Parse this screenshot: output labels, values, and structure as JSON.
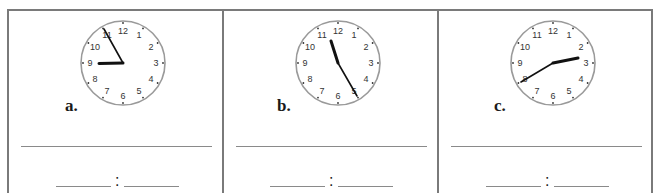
{
  "worksheet": {
    "frame_color": "#7a7a7a",
    "line_color": "#8a8a8a",
    "clocks": [
      {
        "label": "a.",
        "numbers": [
          "12",
          "1",
          "2",
          "3",
          "4",
          "5",
          "6",
          "7",
          "8",
          "9",
          "10",
          "11"
        ],
        "hour_hand_target": "9",
        "minute_hand_target": "11",
        "answer_separator": ":"
      },
      {
        "label": "b.",
        "numbers": [
          "12",
          "1",
          "2",
          "3",
          "4",
          "5",
          "6",
          "7",
          "8",
          "9",
          "10",
          "11"
        ],
        "hour_hand_target": "11",
        "minute_hand_target": "5",
        "answer_separator": ":"
      },
      {
        "label": "c.",
        "numbers": [
          "12",
          "1",
          "2",
          "3",
          "4",
          "5",
          "6",
          "7",
          "8",
          "9",
          "10",
          "11"
        ],
        "hour_hand_target": "3",
        "minute_hand_target": "8",
        "answer_separator": ":"
      }
    ]
  }
}
